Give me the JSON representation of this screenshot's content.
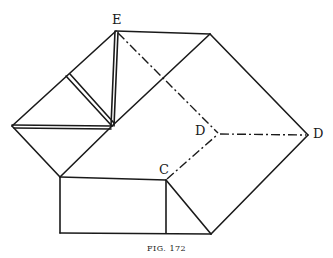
{
  "figure": {
    "caption": "FIG. 172",
    "labels": {
      "E": "E",
      "D_inner": "D",
      "D_outer": "D",
      "C": "C"
    },
    "colors": {
      "line": "#1a1a1a",
      "background": "#ffffff"
    }
  }
}
